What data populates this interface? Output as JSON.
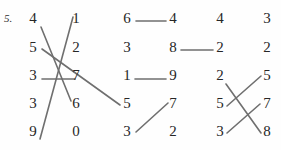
{
  "page": {
    "question_number": "5.",
    "background_color": "#fefefe",
    "digit_color": "#262626",
    "line_color": "#6f6f6f",
    "line_width": 1.6
  },
  "groups": [
    {
      "name": "group-1",
      "left_column": {
        "x": 33,
        "values": [
          "4",
          "5",
          "3",
          "3",
          "9"
        ]
      },
      "right_column": {
        "x": 76,
        "values": [
          "1",
          "2",
          "7",
          "6",
          "0"
        ]
      },
      "rows_y": [
        22,
        51,
        79,
        107,
        135
      ],
      "connections": [
        {
          "from": "left.0",
          "to": "right.3",
          "label": "4-to-6"
        },
        {
          "from": "left.1",
          "to": "external.group2.left.3",
          "label": "5-to-5"
        },
        {
          "from": "left.2",
          "to": "right.2",
          "label": "3-to-7"
        },
        {
          "from": "left.4",
          "to": "right.0",
          "label": "9-to-1"
        }
      ]
    },
    {
      "name": "group-2",
      "left_column": {
        "x": 127,
        "values": [
          "6",
          "3",
          "1",
          "5",
          "3"
        ]
      },
      "right_column": {
        "x": 173,
        "values": [
          "4",
          "8",
          "9",
          "7",
          "2"
        ]
      },
      "rows_y": [
        22,
        51,
        79,
        107,
        135
      ],
      "connections": [
        {
          "from": "left.0",
          "to": "right.0",
          "label": "6-to-4"
        },
        {
          "from": "right.1",
          "to": "external.group3.left.1",
          "label": "8-to-2"
        },
        {
          "from": "left.2",
          "to": "right.2",
          "label": "1-to-9"
        },
        {
          "from": "left.4",
          "to": "right.3",
          "label": "3-to-7"
        }
      ]
    },
    {
      "name": "group-3",
      "left_column": {
        "x": 220,
        "values": [
          "4",
          "2",
          "2",
          "5",
          "3"
        ]
      },
      "right_column": {
        "x": 267,
        "values": [
          "3",
          "2",
          "5",
          "7",
          "8"
        ]
      },
      "rows_y": [
        22,
        51,
        79,
        107,
        135
      ],
      "connections": [
        {
          "from": "left.2",
          "to": "right.4",
          "label": "2-to-8"
        },
        {
          "from": "left.3",
          "to": "right.2",
          "label": "5-to-5"
        },
        {
          "from": "left.4",
          "to": "right.3",
          "label": "3-to-7"
        }
      ]
    }
  ],
  "segments": [
    {
      "name": "seg-4-to-6",
      "x1": 41,
      "y1": 27,
      "x2": 71,
      "y2": 101
    },
    {
      "name": "seg-9-to-1",
      "x1": 40,
      "y1": 139,
      "x2": 73,
      "y2": 17
    },
    {
      "name": "seg-3-to-7",
      "x1": 42,
      "y1": 79,
      "x2": 75,
      "y2": 79
    },
    {
      "name": "seg-5-to-5",
      "x1": 42,
      "y1": 49,
      "x2": 120,
      "y2": 105
    },
    {
      "name": "seg-6-to-4",
      "x1": 136,
      "y1": 21,
      "x2": 166,
      "y2": 21
    },
    {
      "name": "seg-8-to-2",
      "x1": 181,
      "y1": 50,
      "x2": 213,
      "y2": 50
    },
    {
      "name": "seg-1-to-9",
      "x1": 135,
      "y1": 79,
      "x2": 166,
      "y2": 79
    },
    {
      "name": "seg-3-to-7b",
      "x1": 136,
      "y1": 132,
      "x2": 168,
      "y2": 103
    },
    {
      "name": "seg-2-to-8",
      "x1": 226,
      "y1": 84,
      "x2": 261,
      "y2": 133
    },
    {
      "name": "seg-5-to-5b",
      "x1": 227,
      "y1": 106,
      "x2": 261,
      "y2": 76
    },
    {
      "name": "seg-3-to-7c",
      "x1": 227,
      "y1": 133,
      "x2": 260,
      "y2": 104
    }
  ]
}
